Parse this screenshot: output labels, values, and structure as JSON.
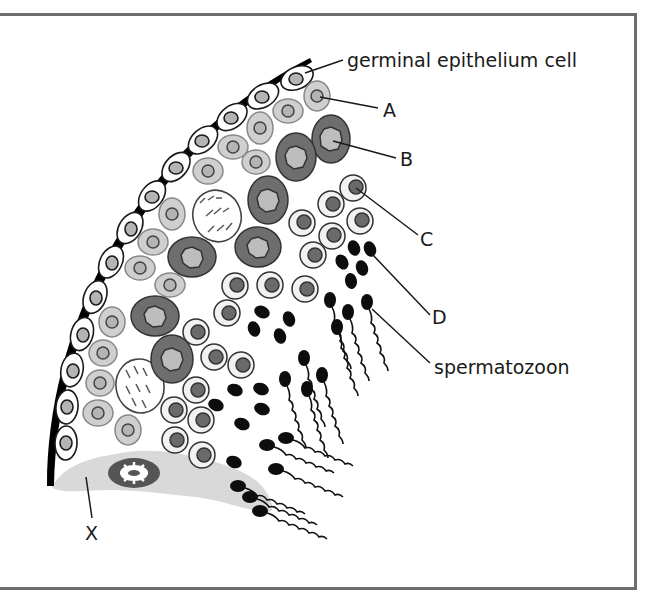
{
  "figure": {
    "type": "diagram",
    "colors": {
      "basement_membrane": "#000000",
      "epithelium_fill": "#ffffff",
      "nucleus_light": "#b4b4b4",
      "primary_spermatocyte_fill": "#6e6e6e",
      "spermatogonium_fill": "#cfcfcf",
      "spermatid_fill": "#6a6a6a",
      "sertoli_cytoplasm": "#d9d9d9",
      "frame": "#6d6d6d",
      "label_text": "#1a1a1a"
    }
  },
  "labels": {
    "germinal": "germinal epithelium cell",
    "a": "A",
    "b": "B",
    "c": "C",
    "d": "D",
    "spermatozoon": "spermatozoon",
    "x": "X"
  }
}
